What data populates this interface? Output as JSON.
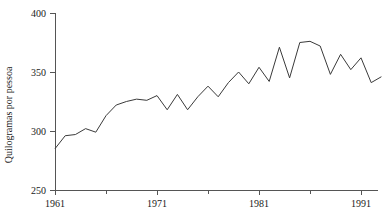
{
  "chart_data": {
    "type": "line",
    "title": "",
    "subtitle": "",
    "xlabel": "",
    "ylabel": "Quilogramas por pessoa",
    "xlim": [
      1960,
      1994
    ],
    "ylim": [
      250,
      400
    ],
    "grid": false,
    "legend": null,
    "x_ticks": [
      1961,
      1971,
      1981,
      1991
    ],
    "x_minor_ticks": [
      1966,
      1976,
      1986
    ],
    "y_ticks": [
      250,
      300,
      350,
      400
    ],
    "line_color": "#3a3a3a",
    "axis_color": "#555555",
    "background_color": "#ffffff",
    "x": [
      1961,
      1962,
      1963,
      1964,
      1965,
      1966,
      1967,
      1968,
      1969,
      1970,
      1971,
      1972,
      1973,
      1974,
      1975,
      1976,
      1977,
      1978,
      1979,
      1980,
      1981,
      1982,
      1983,
      1984,
      1985,
      1986,
      1987,
      1988,
      1989,
      1990,
      1991,
      1992,
      1993
    ],
    "values": [
      285,
      296,
      297,
      302,
      299,
      313,
      322,
      325,
      327,
      326,
      330,
      318,
      331,
      318,
      329,
      338,
      329,
      341,
      350,
      340,
      354,
      342,
      371,
      345,
      375,
      376,
      372,
      348,
      365,
      352,
      362,
      341,
      346
    ],
    "series": [
      {
        "name": "Consumo",
        "values": [
          285,
          296,
          297,
          302,
          299,
          313,
          322,
          325,
          327,
          326,
          330,
          318,
          331,
          318,
          329,
          338,
          329,
          341,
          350,
          340,
          354,
          342,
          371,
          345,
          375,
          376,
          372,
          348,
          365,
          352,
          362,
          341,
          346
        ]
      }
    ]
  },
  "axes": {
    "y_tick_labels": [
      "400",
      "350",
      "300",
      "250"
    ],
    "x_tick_labels": [
      "1961",
      "1971",
      "1981",
      "1991"
    ],
    "y_axis_title": "Quilogramas por pessoa"
  }
}
